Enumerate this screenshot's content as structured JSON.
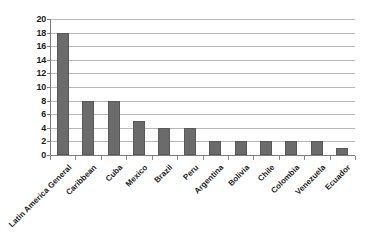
{
  "chart_data": {
    "type": "bar",
    "title": "",
    "subtitle": "",
    "xlabel": "",
    "ylabel": "",
    "categories": [
      "Latin America General",
      "Caribbean",
      "Cuba",
      "Mexico",
      "Brazil",
      "Peru",
      "Argentina",
      "Bolivia",
      "Chile",
      "Colombia",
      "Venezuela",
      "Ecuador"
    ],
    "values": [
      18,
      8,
      8,
      5,
      4,
      4,
      2,
      2,
      2,
      2,
      2,
      1
    ],
    "ylim": [
      0,
      20
    ],
    "ytick_values": [
      0,
      2,
      4,
      6,
      8,
      10,
      12,
      14,
      16,
      18,
      20
    ],
    "ytick_labels": [
      "0",
      "2",
      "4",
      "6",
      "8",
      "10",
      "12",
      "14",
      "16",
      "18",
      "20"
    ],
    "grid": true,
    "grid_axis": "y",
    "legend": false,
    "legend_position": "none",
    "bar_color": "#6b6b6b",
    "bar_edge_color": "#595959",
    "grid_color": "#b9b9b9",
    "axis_color": "#7d7d7d",
    "background_color": "#ffffff",
    "xlabel_rotation": -45
  }
}
